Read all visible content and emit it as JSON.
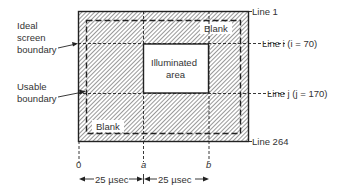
{
  "diagram": {
    "labels": {
      "ideal_boundary": [
        "Ideal",
        "screen",
        "boundary"
      ],
      "usable_boundary": [
        "Usable",
        "boundary"
      ],
      "blank_top": "Blank",
      "blank_bottom": "Blank",
      "illuminated": [
        "Illuminated",
        "area"
      ],
      "line1": "Line 1",
      "line264": "Line 264",
      "line_i": "Line i (i = 70)",
      "line_j": "Line j (j = 170)",
      "axis_0": "0",
      "axis_a": "a",
      "axis_b": "b",
      "span1": "25 µsec",
      "span2": "25 µsec"
    },
    "colors": {
      "ink": "#222222",
      "hatch": "#444444",
      "background": "#ffffff"
    }
  }
}
